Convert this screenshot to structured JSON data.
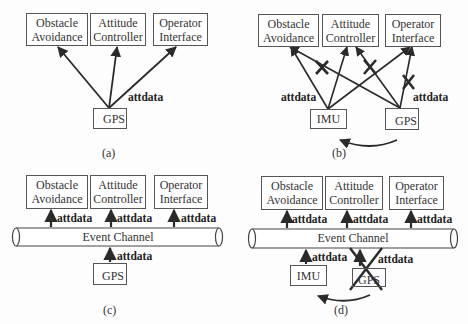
{
  "panels": [
    {
      "id": "a",
      "caption": "(a)",
      "consumers": [
        {
          "line1": "Obstacle",
          "line2": "Avoidance"
        },
        {
          "line1": "Attitude",
          "line2": "Controller"
        },
        {
          "line1": "Operator",
          "line2": "Interface"
        }
      ],
      "sources": [
        {
          "label": "GPS"
        }
      ],
      "edge_labels": [
        "attdata"
      ]
    },
    {
      "id": "b",
      "caption": "(b)",
      "consumers": [
        {
          "line1": "Obstacle",
          "line2": "Avoidance"
        },
        {
          "line1": "Attitude",
          "line2": "Controller"
        },
        {
          "line1": "Operator",
          "line2": "Interface"
        }
      ],
      "sources": [
        {
          "label": "IMU"
        },
        {
          "label": "GPS"
        }
      ],
      "edge_labels": [
        "attdata",
        "attdata"
      ]
    },
    {
      "id": "c",
      "caption": "(c)",
      "channel": "Event Channel",
      "consumers": [
        {
          "line1": "Obstacle",
          "line2": "Avoidance"
        },
        {
          "line1": "Attitude",
          "line2": "Controller"
        },
        {
          "line1": "Operator",
          "line2": "Interface"
        }
      ],
      "sources": [
        {
          "label": "GPS"
        }
      ],
      "edge_labels": [
        "attdata",
        "attdata",
        "attdata",
        "attdata"
      ]
    },
    {
      "id": "d",
      "caption": "(d)",
      "channel": "Event Channel",
      "consumers": [
        {
          "line1": "Obstacle",
          "line2": "Avoidance"
        },
        {
          "line1": "Attitude",
          "line2": "Controller"
        },
        {
          "line1": "Operator",
          "line2": "Interface"
        }
      ],
      "sources": [
        {
          "label": "IMU"
        },
        {
          "label": "GPS"
        }
      ],
      "edge_labels": [
        "attdata",
        "attdata",
        "attdata",
        "attdata",
        "attdata"
      ]
    }
  ],
  "colors": {
    "stroke": "#2a2a2a",
    "box_border": "#555555",
    "background": "#fdfdfd"
  }
}
